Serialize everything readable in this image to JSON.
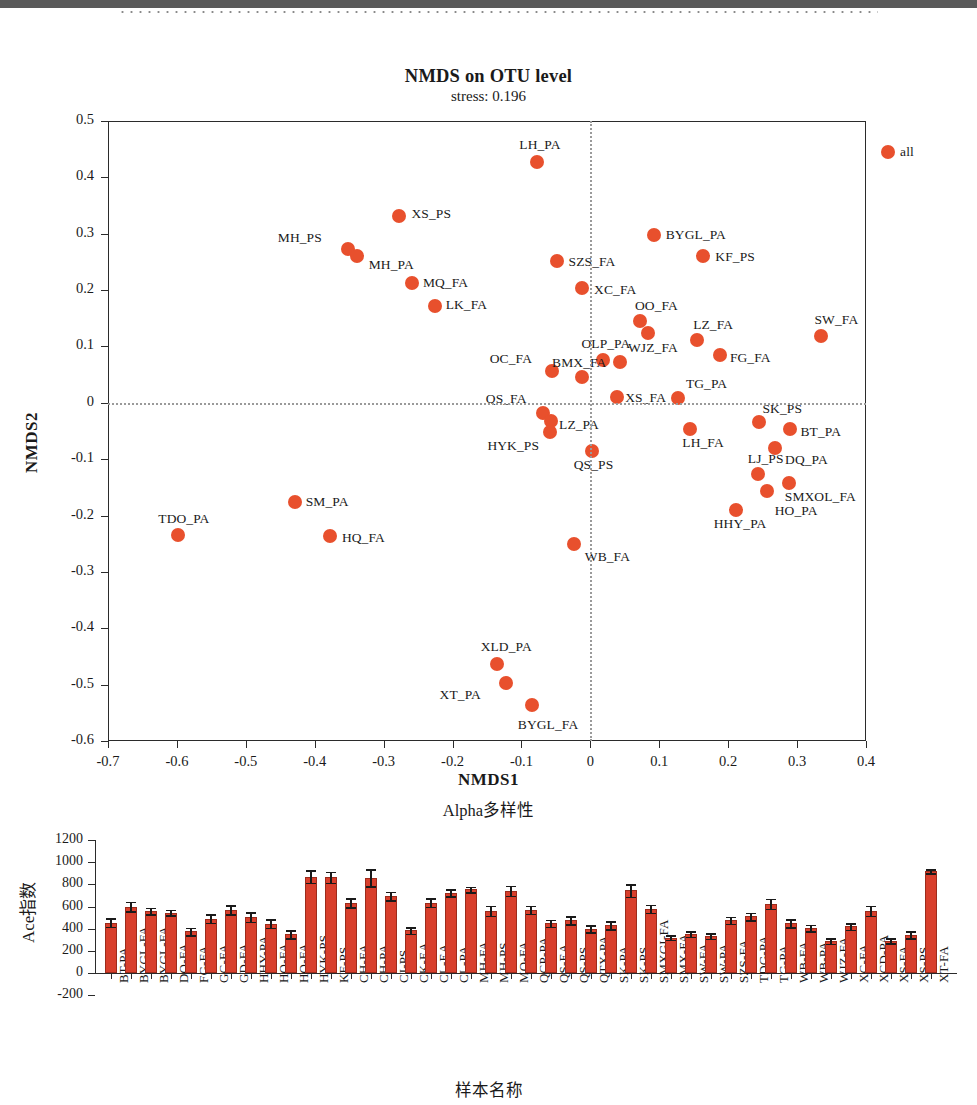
{
  "nmds": {
    "title": "NMDS on OTU level",
    "stress_label": "stress:  0.196",
    "xlabel": "NMDS1",
    "ylabel": "NMDS2"
  },
  "alpha": {
    "title": "Alpha多样性",
    "xlabel": "样本名称",
    "ylabel": "Ace指数"
  },
  "chart_data": [
    {
      "type": "scatter",
      "title": "NMDS on OTU level",
      "subtitle": "stress:  0.196",
      "xlabel": "NMDS1",
      "ylabel": "NMDS2",
      "xlim": [
        -0.7,
        0.4
      ],
      "ylim": [
        -0.6,
        0.5
      ],
      "xticks": [
        -0.7,
        -0.6,
        -0.5,
        -0.4,
        -0.3,
        -0.2,
        -0.1,
        0,
        0.1,
        0.2,
        0.3,
        0.4
      ],
      "xticklabels": [
        "-0.7",
        "-0.6",
        "-0.5",
        "-0.4",
        "-0.3",
        "-0.2",
        "-0.1",
        "0",
        "0.1",
        "0.2",
        "0.3",
        "0.4"
      ],
      "yticks": [
        0.5,
        0.4,
        0.3,
        0.2,
        0.1,
        0,
        -0.1,
        -0.2,
        -0.3,
        -0.4,
        -0.5,
        -0.6
      ],
      "yticklabels": [
        "0.5",
        "0.4",
        "0.3",
        "0.2",
        "0.1",
        "0",
        "-0.1",
        "-0.2",
        "-0.3",
        "-0.4",
        "-0.5",
        "-0.6"
      ],
      "grid": false,
      "reference_lines": {
        "vertical_at_x": 0,
        "horizontal_at_y": 0,
        "style": "dotted"
      },
      "marker_color": "#e8502d",
      "points": [
        {
          "label": "all",
          "x": 0.432,
          "y": 0.445,
          "lab_dx": 12,
          "lab_dy": -6
        },
        {
          "label": "LH_PA",
          "x": -0.077,
          "y": 0.428,
          "lab_dx": -18,
          "lab_dy": -23
        },
        {
          "label": "XS_PS",
          "x": -0.277,
          "y": 0.331,
          "lab_dx": 12,
          "lab_dy": -8
        },
        {
          "label": "BYGL_PA",
          "x": 0.092,
          "y": 0.297,
          "lab_dx": 12,
          "lab_dy": -6
        },
        {
          "label": "MH_PS",
          "x": -0.352,
          "y": 0.273,
          "lab_dx": -70,
          "lab_dy": -17
        },
        {
          "label": "MH_PA",
          "x": -0.339,
          "y": 0.261,
          "lab_dx": 12,
          "lab_dy": 3
        },
        {
          "label": "KF_PS",
          "x": 0.164,
          "y": 0.261,
          "lab_dx": 12,
          "lab_dy": -5
        },
        {
          "label": "SZS_FA",
          "x": -0.049,
          "y": 0.251,
          "lab_dx": 12,
          "lab_dy": -5
        },
        {
          "label": "MQ_FA",
          "x": -0.259,
          "y": 0.212,
          "lab_dx": 11,
          "lab_dy": -6
        },
        {
          "label": "XC_FA",
          "x": -0.012,
          "y": 0.203,
          "lab_dx": 12,
          "lab_dy": -4
        },
        {
          "label": "LK_FA",
          "x": -0.226,
          "y": 0.171,
          "lab_dx": 11,
          "lab_dy": -7
        },
        {
          "label": "OO_FA",
          "x": 0.072,
          "y": 0.145,
          "lab_dx": -5,
          "lab_dy": -21
        },
        {
          "label": "SW_FA",
          "x": 0.334,
          "y": 0.119,
          "lab_dx": -6,
          "lab_dy": -22
        },
        {
          "label": "LZ_FA",
          "x": 0.155,
          "y": 0.112,
          "lab_dx": -4,
          "lab_dy": -21
        },
        {
          "label": "OO_FA_pt2",
          "x": 0.084,
          "y": 0.123,
          "lab_dx": 0,
          "lab_dy": 0,
          "hide_label": true
        },
        {
          "label": "OLP_PA",
          "x": 0.019,
          "y": 0.076,
          "lab_dx": -22,
          "lab_dy": -22
        },
        {
          "label": "WJZ_FA",
          "x": 0.043,
          "y": 0.073,
          "lab_dx": 8,
          "lab_dy": -20
        },
        {
          "label": "FG_FA",
          "x": 0.188,
          "y": 0.085,
          "lab_dx": 10,
          "lab_dy": -3
        },
        {
          "label": "OC_FA",
          "x": -0.056,
          "y": 0.057,
          "lab_dx": -62,
          "lab_dy": -18
        },
        {
          "label": "BMX_FA",
          "x": -0.012,
          "y": 0.046,
          "lab_dx": -30,
          "lab_dy": -20
        },
        {
          "label": "TG_PA",
          "x": 0.127,
          "y": 0.008,
          "lab_dx": 8,
          "lab_dy": -20
        },
        {
          "label": "XS_FA",
          "x": 0.039,
          "y": 0.011,
          "lab_dx": 8,
          "lab_dy": -5
        },
        {
          "label": "QS_FA",
          "x": -0.069,
          "y": -0.018,
          "lab_dx": -57,
          "lab_dy": -20
        },
        {
          "label": "LZ_PA",
          "x": -0.057,
          "y": -0.033,
          "lab_dx": 8,
          "lab_dy": -2
        },
        {
          "label": "SK_PS",
          "x": 0.244,
          "y": -0.034,
          "lab_dx": 4,
          "lab_dy": -19
        },
        {
          "label": "BT_PA",
          "x": 0.289,
          "y": -0.047,
          "lab_dx": 11,
          "lab_dy": -3
        },
        {
          "label": "LH_FA",
          "x": 0.145,
          "y": -0.047,
          "lab_dx": -8,
          "lab_dy": 8
        },
        {
          "label": "HYK_PS",
          "x": -0.058,
          "y": -0.052,
          "lab_dx": -63,
          "lab_dy": 8
        },
        {
          "label": "QS_PS",
          "x": 0.002,
          "y": -0.086,
          "lab_dx": -18,
          "lab_dy": 8
        },
        {
          "label": "DQ_PA",
          "x": 0.268,
          "y": -0.081,
          "lab_dx": 10,
          "lab_dy": 6
        },
        {
          "label": "LJ_PS",
          "x": 0.243,
          "y": -0.126,
          "lab_dx": -10,
          "lab_dy": -21
        },
        {
          "label": "SM_PA",
          "x": -0.429,
          "y": -0.176,
          "lab_dx": 11,
          "lab_dy": -6
        },
        {
          "label": "SMXOL_FA",
          "x": 0.288,
          "y": -0.142,
          "lab_dx": -4,
          "lab_dy": 8
        },
        {
          "label": "HO_PA",
          "x": 0.256,
          "y": -0.156,
          "lab_dx": 8,
          "lab_dy": 14
        },
        {
          "label": "HHY_PA",
          "x": 0.211,
          "y": -0.19,
          "lab_dx": -22,
          "lab_dy": 8
        },
        {
          "label": "TDO_PA",
          "x": -0.598,
          "y": -0.234,
          "lab_dx": -20,
          "lab_dy": -22
        },
        {
          "label": "HQ_FA",
          "x": -0.378,
          "y": -0.236,
          "lab_dx": 12,
          "lab_dy": -4
        },
        {
          "label": "WB_FA",
          "x": -0.024,
          "y": -0.251,
          "lab_dx": 11,
          "lab_dy": 7
        },
        {
          "label": "XLD_PA",
          "x": -0.136,
          "y": -0.464,
          "lab_dx": -16,
          "lab_dy": -23
        },
        {
          "label": "XT_PA",
          "x": -0.123,
          "y": -0.497,
          "lab_dx": -66,
          "lab_dy": 6
        },
        {
          "label": "BYGL_FA",
          "x": -0.085,
          "y": -0.536,
          "lab_dx": -14,
          "lab_dy": 14
        }
      ]
    },
    {
      "type": "bar",
      "title": "Alpha多样性",
      "xlabel": "样本名称",
      "ylabel": "Ace指数",
      "ylim": [
        -200,
        1200
      ],
      "yticks": [
        -200,
        0,
        200,
        400,
        600,
        800,
        1000,
        1200
      ],
      "yticklabels": [
        "-200",
        "0",
        "200",
        "400",
        "600",
        "800",
        "1000",
        "1200"
      ],
      "bar_color": "#d83f2c",
      "error_bars": true,
      "categories": [
        "BT-PA",
        "BYGL-FA",
        "BYGL-FA",
        "DQ-FA",
        "FG-FA",
        "GC-FA",
        "GD-FA",
        "HHY-PA",
        "HQ-FA",
        "HQ-FA",
        "HYK-PS",
        "KF-PS",
        "CH-FA",
        "CH-PA",
        "CJ-PS",
        "CK-EA",
        "CL-EA",
        "CL-PA",
        "MH-FA",
        "MH-PS",
        "MQ-FA",
        "QCP-PA",
        "QS-EA",
        "QS-PS",
        "QTX-PA",
        "SK-PA",
        "SK-PS",
        "SMXGI-FA",
        "SMX-FA",
        "SW-FA",
        "SW-PA",
        "SZS-FA",
        "TDG-PA",
        "TG-PA",
        "WB-FA",
        "WB-PA",
        "WJZ-FA",
        "XC-FA",
        "XCD-PA",
        "XS-FA",
        "XS-PS",
        "XT-FA"
      ],
      "values": [
        455,
        600,
        560,
        545,
        375,
        490,
        570,
        505,
        445,
        350,
        870,
        865,
        635,
        860,
        695,
        385,
        635,
        725,
        755,
        560,
        740,
        570,
        450,
        475,
        400,
        430,
        745,
        580,
        320,
        350,
        335,
        475,
        510,
        625,
        450,
        405,
        290,
        420,
        560,
        290,
        345,
        920
      ],
      "errors": [
        38,
        42,
        28,
        25,
        35,
        38,
        42,
        42,
        38,
        35,
        55,
        50,
        40,
        78,
        38,
        30,
        38,
        32,
        25,
        45,
        45,
        35,
        32,
        35,
        32,
        35,
        55,
        35,
        22,
        25,
        25,
        32,
        32,
        45,
        35,
        30,
        25,
        30,
        45,
        22,
        32,
        18
      ]
    }
  ]
}
